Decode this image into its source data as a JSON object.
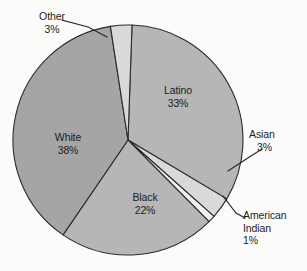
{
  "chart_data": {
    "type": "pie",
    "title": "",
    "categories": [
      "Latino",
      "Asian",
      "American Indian",
      "Black",
      "White",
      "Other"
    ],
    "values": [
      33,
      3,
      1,
      22,
      38,
      3
    ],
    "value_unit": "%",
    "legend": "none",
    "slice_colors": [
      "#b6b6b6",
      "#d9d9d9",
      "#efefef",
      "#b6b6b6",
      "#a5a5a5",
      "#d9d9d9"
    ],
    "labels": [
      {
        "name": "Latino",
        "value": "33%",
        "placement": "inside"
      },
      {
        "name": "Asian",
        "value": "3%",
        "placement": "outside-right"
      },
      {
        "name": "American",
        "name2": "Indian",
        "value": "1%",
        "placement": "outside-right"
      },
      {
        "name": "Black",
        "value": "22%",
        "placement": "inside"
      },
      {
        "name": "White",
        "value": "38%",
        "placement": "inside"
      },
      {
        "name": "Other",
        "value": "3%",
        "placement": "outside-left"
      }
    ],
    "start_angle_deg": 2,
    "direction": "clockwise",
    "center": [
      128,
      140
    ],
    "radius": 115,
    "outline_color": "#2b2b2b",
    "background_color": "#fbfbfa"
  },
  "labels": {
    "other": {
      "name": "Other",
      "value": "3%"
    },
    "latino": {
      "name": "Latino",
      "value": "33%"
    },
    "white": {
      "name": "White",
      "value": "38%"
    },
    "black": {
      "name": "Black",
      "value": "22%"
    },
    "asian": {
      "name": "Asian",
      "value": "3%"
    },
    "american_indian": {
      "name": "American",
      "name2": "Indian",
      "value": "1%"
    }
  }
}
